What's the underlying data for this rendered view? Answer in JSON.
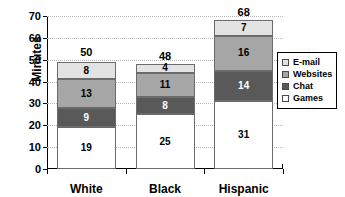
{
  "chart_data": {
    "type": "bar",
    "subtype": "stacked-vertical",
    "title": "",
    "xlabel": "",
    "ylabel": "Minutes",
    "categories": [
      "White",
      "Black",
      "Hispanic"
    ],
    "series": [
      {
        "name": "Games",
        "values": [
          19,
          25,
          31
        ],
        "color": "#ffffff"
      },
      {
        "name": "Chat",
        "values": [
          9,
          8,
          14
        ],
        "color": "#595959"
      },
      {
        "name": "Websites",
        "values": [
          13,
          11,
          16
        ],
        "color": "#a6a6a6"
      },
      {
        "name": "E-mail",
        "values": [
          8,
          4,
          7
        ],
        "color": "#e3e3e3"
      }
    ],
    "totals": [
      50,
      48,
      68
    ],
    "ylim": [
      0,
      70
    ],
    "yticks": [
      0,
      10,
      20,
      30,
      40,
      50,
      60,
      70
    ],
    "ytick_labels": [
      "0",
      "10",
      "20",
      "30",
      "40",
      "50",
      "60",
      "70"
    ],
    "grid": true,
    "grid_axis": "y",
    "legend_position": "right",
    "legend_order": [
      "E-mail",
      "Websites",
      "Chat",
      "Games"
    ],
    "legend_colors": [
      "#e3e3e3",
      "#a6a6a6",
      "#595959",
      "#ffffff"
    ],
    "bar_border_color": "#6b6b6b",
    "gridline_color": "#b9b9b9",
    "axis_color": "#000000",
    "background": "#ffffff"
  }
}
